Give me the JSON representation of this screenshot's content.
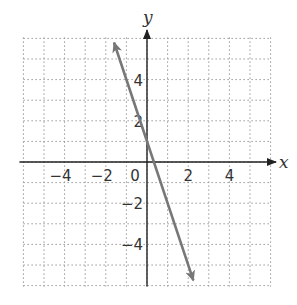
{
  "chart_data": {
    "type": "line",
    "title": "",
    "xlabel": "x",
    "ylabel": "y",
    "xlim": [
      -6,
      6
    ],
    "ylim": [
      -6,
      6
    ],
    "grid": true,
    "grid_style": "dotted",
    "x_ticks": [
      -4,
      -2,
      0,
      2,
      4
    ],
    "y_ticks": [
      -4,
      -2,
      2,
      4
    ],
    "x_tick_labels": [
      "−4",
      "−2",
      "0",
      "2",
      "4"
    ],
    "y_tick_labels": [
      "−4",
      "−2",
      "2",
      "4"
    ],
    "series": [
      {
        "name": "y = -3x + 1",
        "slope": -3,
        "intercept": 1,
        "x": [
          -1.6,
          2.25
        ],
        "y": [
          5.8,
          -5.75
        ],
        "arrows": "both",
        "color": "#777777"
      }
    ]
  },
  "labels": {
    "x_axis": "x",
    "y_axis": "y"
  }
}
